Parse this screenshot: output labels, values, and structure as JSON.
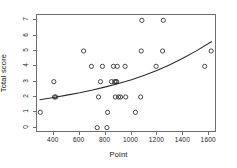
{
  "chart_data": {
    "type": "scatter",
    "title": "",
    "xlabel": "Point",
    "ylabel": "Total score",
    "xlim": [
      270,
      1660
    ],
    "ylim": [
      -0.35,
      7.35
    ],
    "grid": false,
    "legend": null,
    "xticks": [
      400,
      600,
      800,
      1000,
      1200,
      1400,
      1600
    ],
    "yticks": [
      0,
      1,
      2,
      3,
      4,
      5,
      6,
      7
    ],
    "xtick_labels": [
      "400",
      "600",
      "800",
      "1000",
      "1200",
      "1400",
      "1600"
    ],
    "ytick_labels": [
      "0",
      "1",
      "2",
      "3",
      "4",
      "5",
      "6",
      "7"
    ],
    "marker": "open-circle",
    "points": [
      {
        "x": 295,
        "y": 1
      },
      {
        "x": 400,
        "y": 3
      },
      {
        "x": 405,
        "y": 2
      },
      {
        "x": 415,
        "y": 2
      },
      {
        "x": 630,
        "y": 5
      },
      {
        "x": 690,
        "y": 4
      },
      {
        "x": 735,
        "y": 0
      },
      {
        "x": 745,
        "y": 2
      },
      {
        "x": 760,
        "y": 3
      },
      {
        "x": 775,
        "y": 4
      },
      {
        "x": 810,
        "y": 0
      },
      {
        "x": 815,
        "y": 1
      },
      {
        "x": 845,
        "y": 3
      },
      {
        "x": 860,
        "y": 4
      },
      {
        "x": 870,
        "y": 3
      },
      {
        "x": 875,
        "y": 2
      },
      {
        "x": 880,
        "y": 3
      },
      {
        "x": 885,
        "y": 3
      },
      {
        "x": 890,
        "y": 4
      },
      {
        "x": 900,
        "y": 2
      },
      {
        "x": 915,
        "y": 2
      },
      {
        "x": 950,
        "y": 4
      },
      {
        "x": 955,
        "y": 2
      },
      {
        "x": 1030,
        "y": 1
      },
      {
        "x": 1070,
        "y": 2
      },
      {
        "x": 1075,
        "y": 5
      },
      {
        "x": 1080,
        "y": 7
      },
      {
        "x": 1190,
        "y": 4
      },
      {
        "x": 1240,
        "y": 5
      },
      {
        "x": 1245,
        "y": 7
      },
      {
        "x": 1565,
        "y": 4
      },
      {
        "x": 1615,
        "y": 5
      }
    ],
    "fit_curve": {
      "name": "fitted trend",
      "style": "solid",
      "x": [
        290,
        400,
        500,
        600,
        700,
        800,
        900,
        1000,
        1100,
        1200,
        1300,
        1400,
        1500,
        1620
      ],
      "y": [
        1.82,
        1.97,
        2.12,
        2.28,
        2.46,
        2.66,
        2.88,
        3.13,
        3.42,
        3.75,
        4.12,
        4.54,
        5.01,
        5.62
      ]
    }
  },
  "axes": {
    "x_title": "Point",
    "y_title": "Total score"
  }
}
